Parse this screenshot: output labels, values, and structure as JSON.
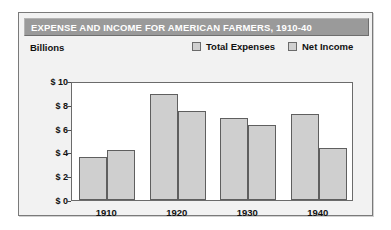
{
  "card": {
    "title": "EXPENSE AND INCOME FOR AMERICAN FARMERS, 1910-40",
    "units_label": "Billions"
  },
  "legend": {
    "items": [
      {
        "label": "Total Expenses",
        "color": "#cfcfcf"
      },
      {
        "label": "Net Income",
        "color": "#cfcfcf"
      }
    ]
  },
  "axis": {
    "y_ticks": [
      "$ 10",
      "$ 8",
      "$ 6",
      "$ 4",
      "$ 2",
      "$ 0"
    ],
    "x_ticks": [
      "1910",
      "1920",
      "1930",
      "1940"
    ]
  },
  "colors": {
    "title_bar": "#9a9a9a",
    "title_text": "#ffffff",
    "bar_fill": "#cfcfcf",
    "bar_stroke": "#5f5f5f",
    "card_background": "#f2f2f2",
    "plot_background": "#ffffff"
  },
  "chart_data": {
    "type": "bar",
    "title": "EXPENSE AND INCOME FOR AMERICAN FARMERS, 1910-40",
    "xlabel": "",
    "ylabel": "Billions",
    "ylim": [
      0,
      10
    ],
    "ytick_values": [
      10,
      8,
      6,
      4,
      2,
      0
    ],
    "ytick_labels": [
      "$ 10",
      "$ 8",
      "$ 6",
      "$ 4",
      "$ 2",
      "$ 0"
    ],
    "grid": false,
    "legend_position": "top-right",
    "categories": [
      "1910",
      "1920",
      "1930",
      "1940"
    ],
    "series": [
      {
        "name": "Total Expenses",
        "values": [
          3.6,
          8.9,
          6.9,
          7.2
        ]
      },
      {
        "name": "Net Income",
        "values": [
          4.2,
          7.5,
          6.3,
          4.4
        ]
      }
    ]
  }
}
